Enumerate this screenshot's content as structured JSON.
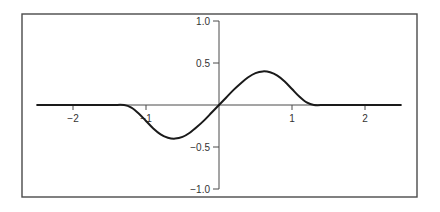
{
  "chart_data": {
    "type": "line",
    "title": "",
    "xlabel": "",
    "ylabel": "",
    "xlim": [
      -2.5,
      2.5
    ],
    "ylim": [
      -1.0,
      1.0
    ],
    "grid": false,
    "legend": null,
    "x_ticks": [
      {
        "value": -2,
        "label": "−2"
      },
      {
        "value": -1,
        "label": "−1"
      },
      {
        "value": 1,
        "label": "1"
      },
      {
        "value": 2,
        "label": "2"
      }
    ],
    "y_ticks": [
      {
        "value": 1.0,
        "label": "1.0"
      },
      {
        "value": 0.5,
        "label": "0.5"
      },
      {
        "value": -0.5,
        "label": "−0.5"
      },
      {
        "value": -1.0,
        "label": "−1.0"
      }
    ],
    "series": [
      {
        "name": "curve",
        "color": "#1a1a1a",
        "x": [
          -2.5,
          -2.0,
          -1.5,
          -1.3,
          -1.2,
          -1.1,
          -1.0,
          -0.9,
          -0.8,
          -0.7,
          -0.6,
          -0.5,
          -0.4,
          -0.3,
          -0.2,
          -0.1,
          0.0,
          0.1,
          0.2,
          0.3,
          0.4,
          0.5,
          0.6,
          0.7,
          0.8,
          0.9,
          1.0,
          1.1,
          1.2,
          1.3,
          1.5,
          2.0,
          2.5
        ],
        "y": [
          0,
          0,
          0,
          0,
          -0.03,
          -0.1,
          -0.19,
          -0.28,
          -0.35,
          -0.39,
          -0.4,
          -0.38,
          -0.33,
          -0.26,
          -0.18,
          -0.09,
          0.0,
          0.09,
          0.18,
          0.26,
          0.33,
          0.38,
          0.4,
          0.39,
          0.35,
          0.28,
          0.19,
          0.1,
          0.03,
          0,
          0,
          0,
          0
        ]
      }
    ]
  },
  "layout": {
    "frame": {
      "left": 22,
      "top": 14,
      "right": 417,
      "bottom": 197
    },
    "origin_px": {
      "x": 219,
      "y": 105
    },
    "px_per_unit_x": 73,
    "px_per_unit_y": 84
  }
}
